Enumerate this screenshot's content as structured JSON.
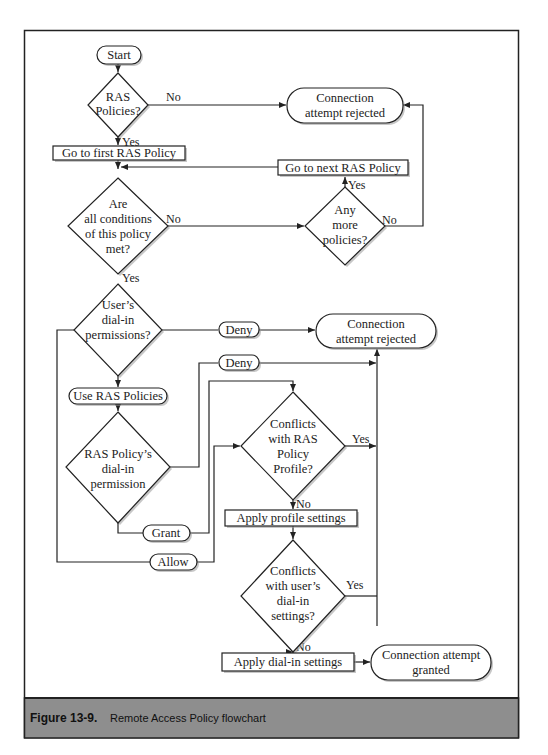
{
  "figure": {
    "caption_label": "Figure 13-9.",
    "caption_text": "Remote Access Policy flowchart",
    "caption_bg": "#8e8e8e",
    "frame_color": "#222222"
  },
  "nodes": {
    "start": {
      "lines": [
        "Start"
      ]
    },
    "ras_policies": {
      "lines": [
        "RAS",
        "Policies?"
      ]
    },
    "rejected_top": {
      "lines": [
        "Connection",
        "attempt rejected"
      ]
    },
    "go_first": {
      "lines": [
        "Go to first RAS Policy"
      ]
    },
    "go_next": {
      "lines": [
        "Go to next RAS Policy"
      ]
    },
    "all_conditions": {
      "lines": [
        "Are",
        "all conditions",
        "of this policy",
        "met?"
      ]
    },
    "any_more": {
      "lines": [
        "Any",
        "more",
        "policies?"
      ]
    },
    "user_dialin": {
      "lines": [
        "User’s",
        "dial-in",
        "permissions?"
      ]
    },
    "rejected_mid": {
      "lines": [
        "Connection",
        "attempt rejected"
      ]
    },
    "deny_1": {
      "lines": [
        "Deny"
      ]
    },
    "deny_2": {
      "lines": [
        "Deny"
      ]
    },
    "use_ras": {
      "lines": [
        "Use RAS Policies"
      ]
    },
    "ras_policy_dialin": {
      "lines": [
        "RAS Policy’s",
        "dial-in",
        "permission"
      ]
    },
    "grant": {
      "lines": [
        "Grant"
      ]
    },
    "allow": {
      "lines": [
        "Allow"
      ]
    },
    "conflicts_profile": {
      "lines": [
        "Conflicts",
        "with RAS",
        "Policy",
        "Profile?"
      ]
    },
    "apply_profile": {
      "lines": [
        "Apply profile settings"
      ]
    },
    "conflicts_user": {
      "lines": [
        "Conflicts",
        "with user’s",
        "dial-in",
        "settings?"
      ]
    },
    "apply_dialin": {
      "lines": [
        "Apply dial-in settings"
      ]
    },
    "granted": {
      "lines": [
        "Connection attempt",
        "granted"
      ]
    }
  },
  "edge_labels": {
    "ras_no": "No",
    "ras_yes": "Yes",
    "cond_no": "No",
    "cond_yes": "Yes",
    "more_yes": "Yes",
    "more_no": "No",
    "profile_yes": "Yes",
    "profile_no": "No",
    "user_yes": "Yes",
    "user_no": "No"
  }
}
